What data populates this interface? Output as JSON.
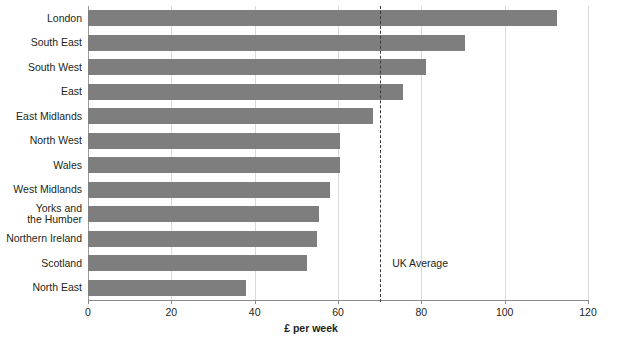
{
  "chart_data": {
    "type": "bar",
    "orientation": "horizontal",
    "title": "",
    "xlabel": "£ per week",
    "ylabel": "",
    "xlim": [
      0,
      120
    ],
    "xticks": [
      0,
      20,
      40,
      60,
      80,
      100,
      120
    ],
    "xtick_labels": [
      "0",
      "20",
      "40",
      "60",
      "80",
      "100",
      "120"
    ],
    "grid": true,
    "grid_axis": "x",
    "legend": false,
    "bar_color": "#7e7e7e",
    "categories": [
      "London",
      "South East",
      "South West",
      "East",
      "East Midlands",
      "North West",
      "Wales",
      "West Midlands",
      "Yorks and\nthe Humber",
      "Northern Ireland",
      "Scotland",
      "North East"
    ],
    "values": [
      112.5,
      90.5,
      81.0,
      75.5,
      68.5,
      60.5,
      60.5,
      58.0,
      55.5,
      55.0,
      52.5,
      38.0
    ],
    "annotations": [
      {
        "name": "uk-average",
        "label": "UK Average",
        "value": 70,
        "style": "dashed-vertical-line",
        "color": "#3b3b3b",
        "label_x": 73,
        "label_y_category_index": 10
      }
    ]
  }
}
